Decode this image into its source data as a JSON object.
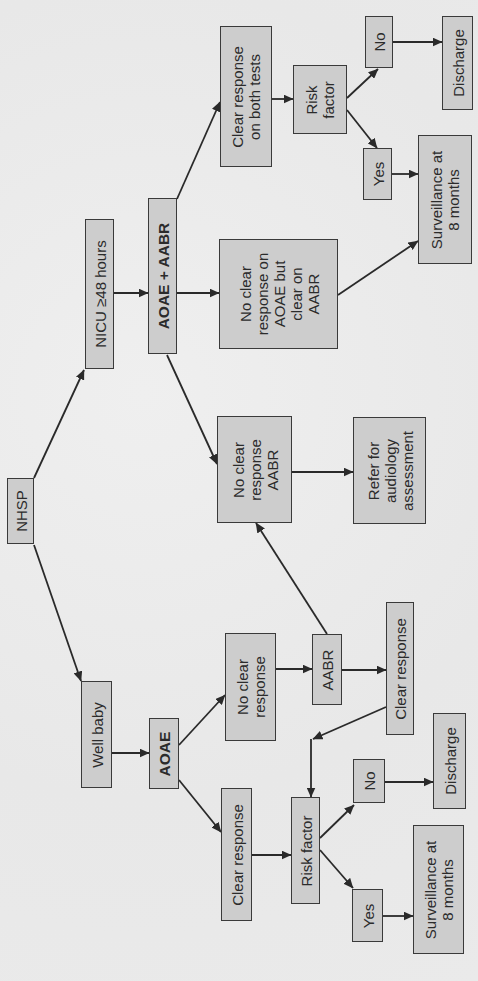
{
  "diagram": {
    "type": "flowchart",
    "orientation": "rotated-90-ccw",
    "nodes": {
      "nhsp": [
        "NHSP"
      ],
      "nicu": [
        "NICU ≥48 hours"
      ],
      "well_baby": [
        "Well baby"
      ],
      "aoae_aabr": [
        "AOAE + AABR"
      ],
      "aoae": [
        "AOAE"
      ],
      "clear_both": [
        "Clear response",
        "on both tests"
      ],
      "no_clear_aoae_clear_aabr": [
        "No clear",
        "response on",
        "AOAE but",
        "clear on",
        "AABR"
      ],
      "no_clear_aabr": [
        "No clear",
        "response",
        "AABR"
      ],
      "refer": [
        "Refer for",
        "audiology",
        "assessment"
      ],
      "risk_factor_nicu": [
        "Risk",
        "factor"
      ],
      "no_nicu": [
        "No"
      ],
      "yes_nicu": [
        "Yes"
      ],
      "discharge_nicu": [
        "Discharge"
      ],
      "surveillance_nicu": [
        "Surveillance at",
        "8 months"
      ],
      "no_clear_well": [
        "No clear",
        "response"
      ],
      "aabr_well": [
        "AABR"
      ],
      "clear_response_aabr": [
        "Clear response"
      ],
      "clear_response_aoae": [
        "Clear response"
      ],
      "risk_factor_well": [
        "Risk factor"
      ],
      "no_well": [
        "No"
      ],
      "yes_well": [
        "Yes"
      ],
      "discharge_well": [
        "Discharge"
      ],
      "surveillance_well": [
        "Surveillance at",
        "8 months"
      ]
    },
    "edges": [
      [
        "nhsp",
        "nicu"
      ],
      [
        "nhsp",
        "well_baby"
      ],
      [
        "nicu",
        "aoae_aabr"
      ],
      [
        "aoae_aabr",
        "clear_both"
      ],
      [
        "aoae_aabr",
        "no_clear_aoae_clear_aabr"
      ],
      [
        "aoae_aabr",
        "no_clear_aabr"
      ],
      [
        "clear_both",
        "risk_factor_nicu"
      ],
      [
        "risk_factor_nicu",
        "no_nicu"
      ],
      [
        "risk_factor_nicu",
        "yes_nicu"
      ],
      [
        "no_nicu",
        "discharge_nicu"
      ],
      [
        "yes_nicu",
        "surveillance_nicu"
      ],
      [
        "no_clear_aoae_clear_aabr",
        "surveillance_nicu"
      ],
      [
        "no_clear_aabr",
        "refer"
      ],
      [
        "well_baby",
        "aoae"
      ],
      [
        "aoae",
        "no_clear_well"
      ],
      [
        "aoae",
        "clear_response_aoae"
      ],
      [
        "no_clear_well",
        "aabr_well"
      ],
      [
        "aabr_well",
        "clear_response_aabr"
      ],
      [
        "aabr_well",
        "no_clear_aabr"
      ],
      [
        "clear_response_aabr",
        "risk_factor_well"
      ],
      [
        "clear_response_aoae",
        "risk_factor_well"
      ],
      [
        "risk_factor_well",
        "no_well"
      ],
      [
        "risk_factor_well",
        "yes_well"
      ],
      [
        "no_well",
        "discharge_well"
      ],
      [
        "yes_well",
        "surveillance_well"
      ]
    ]
  },
  "colors": {
    "background": "#ebebeb",
    "box_fill": "#cdcdcd",
    "box_border": "#3a3a3a",
    "text": "#2b2b2b"
  }
}
